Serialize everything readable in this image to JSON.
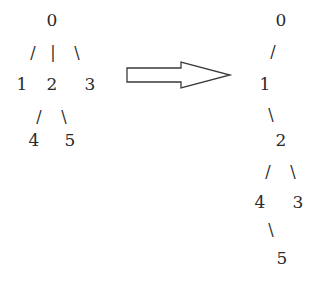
{
  "left_tree": {
    "nodes": [
      {
        "id": "0",
        "label": "0",
        "x": 52,
        "y": 20
      },
      {
        "id": "1",
        "label": "1",
        "x": 22,
        "y": 84
      },
      {
        "id": "2",
        "label": "2",
        "x": 52,
        "y": 84
      },
      {
        "id": "3",
        "label": "3",
        "x": 90,
        "y": 84
      },
      {
        "id": "4",
        "label": "4",
        "x": 34,
        "y": 140
      },
      {
        "id": "5",
        "label": "5",
        "x": 70,
        "y": 140
      }
    ],
    "edges": [
      {
        "from": "0",
        "to": "1",
        "glyph": "/",
        "x": 33,
        "y": 53
      },
      {
        "from": "0",
        "to": "2",
        "glyph": "|",
        "x": 53,
        "y": 53
      },
      {
        "from": "0",
        "to": "3",
        "glyph": "\\",
        "x": 77,
        "y": 53
      },
      {
        "from": "2",
        "to": "4",
        "glyph": "/",
        "x": 39,
        "y": 117
      },
      {
        "from": "2",
        "to": "5",
        "glyph": "\\",
        "x": 64,
        "y": 117
      }
    ]
  },
  "arrow": {
    "direction": "right",
    "label": "transforms-to"
  },
  "right_tree": {
    "nodes": [
      {
        "id": "0",
        "label": "0",
        "x": 281,
        "y": 20
      },
      {
        "id": "1",
        "label": "1",
        "x": 265,
        "y": 84
      },
      {
        "id": "2",
        "label": "2",
        "x": 281,
        "y": 140
      },
      {
        "id": "4",
        "label": "4",
        "x": 260,
        "y": 202
      },
      {
        "id": "3",
        "label": "3",
        "x": 298,
        "y": 202
      },
      {
        "id": "5",
        "label": "5",
        "x": 282,
        "y": 258
      }
    ],
    "edges": [
      {
        "from": "0",
        "to": "1",
        "glyph": "/",
        "x": 273,
        "y": 52
      },
      {
        "from": "1",
        "to": "2",
        "glyph": "\\",
        "x": 271,
        "y": 115
      },
      {
        "from": "2",
        "to": "4",
        "glyph": "/",
        "x": 268,
        "y": 172
      },
      {
        "from": "2",
        "to": "3",
        "glyph": "\\",
        "x": 293,
        "y": 172
      },
      {
        "from": "4",
        "to": "5",
        "glyph": "\\",
        "x": 271,
        "y": 230
      }
    ]
  }
}
